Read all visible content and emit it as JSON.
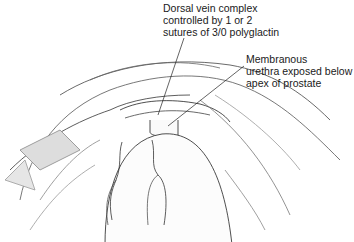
{
  "figure": {
    "type": "surgical-illustration",
    "labels": [
      {
        "id": "dorsal-vein-complex",
        "lines": [
          "Dorsal vein complex",
          "controlled by 1 or 2",
          "sutures of 3/0 polyglactin"
        ]
      },
      {
        "id": "membranous-urethra",
        "lines": [
          "Membranous",
          "urethra exposed below",
          "apex of prostate"
        ]
      }
    ]
  }
}
